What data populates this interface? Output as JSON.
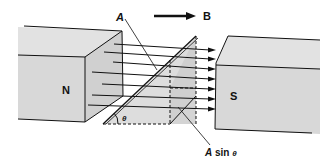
{
  "figure": {
    "north_label": "N",
    "south_label": "S",
    "field_label": "B",
    "area_label": "A",
    "projected_area_label": "A sin θ",
    "projected_area_var": "A",
    "projected_area_func": " sin ",
    "angle_label": "θ",
    "field_line_count": 7,
    "colors": {
      "magnet_fill": "#d9d9d9",
      "magnet_top": "#e4e4e4",
      "line": "#111111",
      "plane_fill": "#cfcfcf"
    }
  }
}
